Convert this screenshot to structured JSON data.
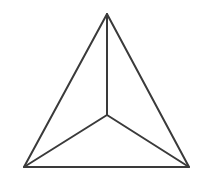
{
  "figure": {
    "name": "tetrahedron-wireframe",
    "description": "Line drawing of a tetrahedron (triangular pyramid) seen from above: an equilateral outer triangle with three internal edges meeting at an interior central vertex.",
    "background_color": "#ffffff",
    "stroke_color": "#3a3a3a",
    "stroke_width": 2,
    "canvas": {
      "width": 198,
      "height": 180
    },
    "vertices": {
      "apex": {
        "label": "apex",
        "x": 107,
        "y": 14
      },
      "bottom_left": {
        "label": "bottom-left",
        "x": 24,
        "y": 167
      },
      "bottom_right": {
        "label": "bottom-right",
        "x": 189,
        "y": 167
      },
      "center": {
        "label": "center",
        "x": 107,
        "y": 115
      }
    },
    "edges": [
      {
        "name": "outer-left-edge",
        "from": "apex",
        "to": "bottom_left",
        "type": "outer"
      },
      {
        "name": "outer-right-edge",
        "from": "apex",
        "to": "bottom_right",
        "type": "outer"
      },
      {
        "name": "outer-bottom-edge",
        "from": "bottom_left",
        "to": "bottom_right",
        "type": "outer"
      },
      {
        "name": "inner-edge-to-apex",
        "from": "center",
        "to": "apex",
        "type": "inner"
      },
      {
        "name": "inner-edge-to-bottom-left",
        "from": "center",
        "to": "bottom_left",
        "type": "inner"
      },
      {
        "name": "inner-edge-to-bottom-right",
        "from": "center",
        "to": "bottom_right",
        "type": "inner"
      }
    ],
    "paths": {
      "outer_triangle": "M 107 14 L 24 167 L 189 167 Z",
      "inner_spoke_apex": "M 107 115 L 107 14",
      "inner_spoke_bottom_left": "M 107 115 L 24 167",
      "inner_spoke_bottom_right": "M 107 115 L 189 167"
    }
  }
}
